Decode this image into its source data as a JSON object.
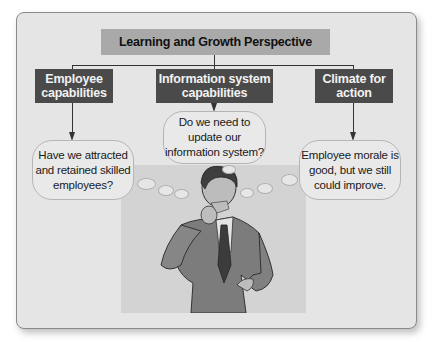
{
  "diagram": {
    "title": "Learning and Growth Perspective",
    "categories": [
      {
        "label_line1": "Employee",
        "label_line2": "capabilities",
        "question_lines": [
          "Have we attracted",
          "and retained skilled",
          "employees?"
        ]
      },
      {
        "label_line1": "Information system",
        "label_line2": "capabilities",
        "question_lines": [
          "Do we need to",
          "update our",
          "information system?"
        ]
      },
      {
        "label_line1": "Climate for",
        "label_line2": "action",
        "question_lines": [
          "Employee morale is",
          "good, but we still",
          "could improve."
        ]
      }
    ],
    "illustration": "thinking-businessman",
    "colors": {
      "panel_bg": "#e5e5e5",
      "title_box": "#a9a9a9",
      "category_box": "#4a4a4a",
      "category_text": "#f2f2f2",
      "bubble_bg": "#e9e9e9"
    }
  }
}
